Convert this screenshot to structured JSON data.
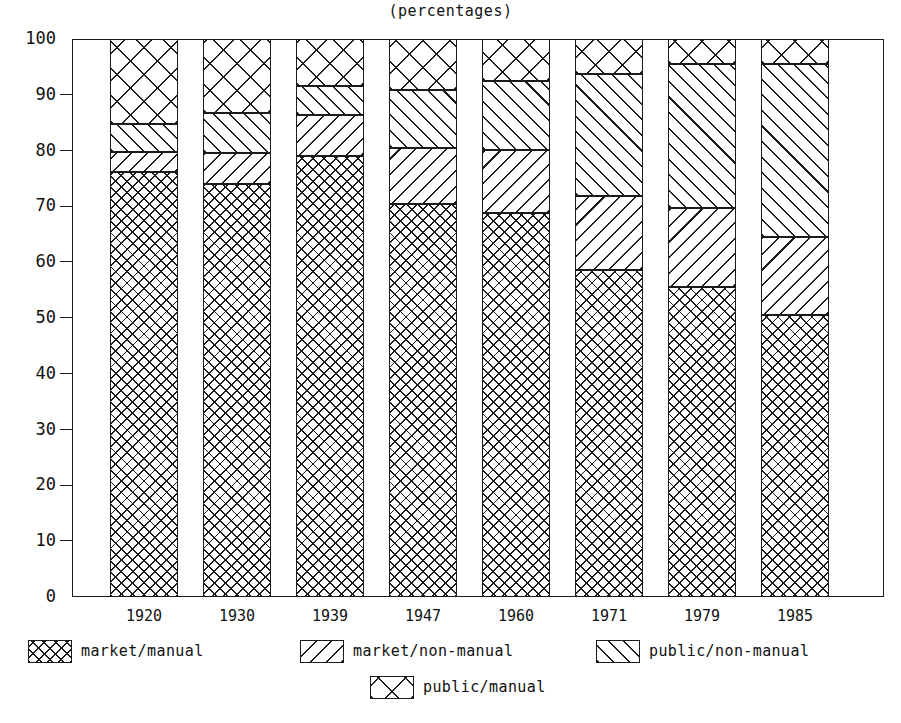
{
  "chart_data": {
    "type": "bar",
    "subtype": "stacked-bar-100",
    "title": "(percentages)",
    "xlabel": "",
    "ylabel": "",
    "ylim": [
      0,
      100
    ],
    "yticks": [
      0,
      10,
      20,
      30,
      40,
      50,
      60,
      70,
      80,
      90,
      100
    ],
    "grid": false,
    "legend_position": "bottom",
    "categories": [
      "1920",
      "1930",
      "1939",
      "1947",
      "1960",
      "1971",
      "1979",
      "1985"
    ],
    "series": [
      {
        "name": "market/manual",
        "pattern": "dense-crosshatch",
        "values": [
          76.2,
          74.0,
          79.0,
          70.4,
          68.8,
          58.6,
          55.6,
          50.5
        ]
      },
      {
        "name": "market/non-manual",
        "pattern": "backslash-hatch",
        "values": [
          3.5,
          5.5,
          7.4,
          10.1,
          11.3,
          13.3,
          14.1,
          14.0
        ]
      },
      {
        "name": "public/non-manual",
        "pattern": "forwardslash-hatch",
        "values": [
          5.1,
          7.3,
          5.1,
          10.3,
          12.4,
          21.8,
          25.8,
          31.0
        ]
      },
      {
        "name": "public/manual",
        "pattern": "open-crosshatch",
        "values": [
          15.2,
          13.2,
          8.5,
          9.2,
          7.5,
          6.3,
          4.5,
          4.5
        ]
      }
    ],
    "cumulative_tops": {
      "market/manual": [
        76.2,
        74.0,
        79.0,
        70.4,
        68.8,
        58.6,
        55.6,
        50.5
      ],
      "market/non-manual": [
        79.7,
        79.5,
        86.4,
        80.5,
        80.1,
        71.9,
        69.7,
        64.5
      ],
      "public/non-manual": [
        84.8,
        86.8,
        91.5,
        90.8,
        92.5,
        93.7,
        95.5,
        95.5
      ],
      "public/manual": [
        100,
        100,
        100,
        100,
        100,
        100,
        100,
        100
      ]
    }
  },
  "axis": {
    "y_tick_labels": [
      "100",
      "90",
      "80",
      "70",
      "60",
      "50",
      "40",
      "30",
      "20",
      "10",
      "0"
    ],
    "x_tick_labels": [
      "1920",
      "1930",
      "1939",
      "1947",
      "1960",
      "1971",
      "1979",
      "1985"
    ]
  },
  "legend": {
    "items": [
      {
        "label": "market/manual",
        "pattern": "dense-crosshatch"
      },
      {
        "label": "market/non-manual",
        "pattern": "backslash-hatch"
      },
      {
        "label": "public/non-manual",
        "pattern": "forwardslash-hatch"
      },
      {
        "label": "public/manual",
        "pattern": "open-crosshatch"
      }
    ]
  },
  "colors": {
    "ink": "#1b1b1b",
    "background": "#ffffff"
  }
}
